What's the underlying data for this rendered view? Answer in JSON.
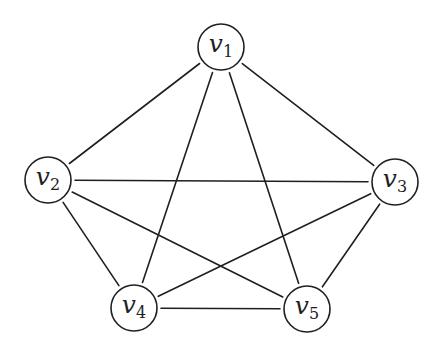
{
  "diagram": {
    "type": "graph",
    "colors": {
      "stroke": "#1f1f1f",
      "fill": "#ffffff"
    },
    "nodes": [
      {
        "id": "v1",
        "base": "v",
        "sub": "1",
        "x": 221,
        "y": 47
      },
      {
        "id": "v2",
        "base": "v",
        "sub": "2",
        "x": 48,
        "y": 180
      },
      {
        "id": "v3",
        "base": "v",
        "sub": "3",
        "x": 395,
        "y": 182
      },
      {
        "id": "v4",
        "base": "v",
        "sub": "4",
        "x": 134,
        "y": 308
      },
      {
        "id": "v5",
        "base": "v",
        "sub": "5",
        "x": 307,
        "y": 309
      }
    ],
    "node_radius": 23,
    "edges": [
      [
        "v1",
        "v2"
      ],
      [
        "v1",
        "v3"
      ],
      [
        "v1",
        "v4"
      ],
      [
        "v1",
        "v5"
      ],
      [
        "v2",
        "v3"
      ],
      [
        "v2",
        "v4"
      ],
      [
        "v2",
        "v5"
      ],
      [
        "v3",
        "v4"
      ],
      [
        "v3",
        "v5"
      ],
      [
        "v4",
        "v5"
      ]
    ]
  }
}
